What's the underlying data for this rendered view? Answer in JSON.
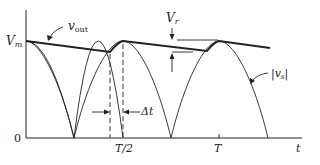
{
  "diagram": {
    "labels": {
      "vout": "v",
      "vout_sub": "out",
      "vm": "V",
      "vm_sub": "m",
      "vr": "V",
      "vr_sub": "r",
      "vs": "|v",
      "vs_sub": "s",
      "vs_close": "|",
      "delta_t": "Δt",
      "zero": "0",
      "t_half": "T/2",
      "t_full": "T",
      "t_axis": "t"
    },
    "colors": {
      "stroke": "#222222",
      "background": "#ffffff"
    }
  }
}
